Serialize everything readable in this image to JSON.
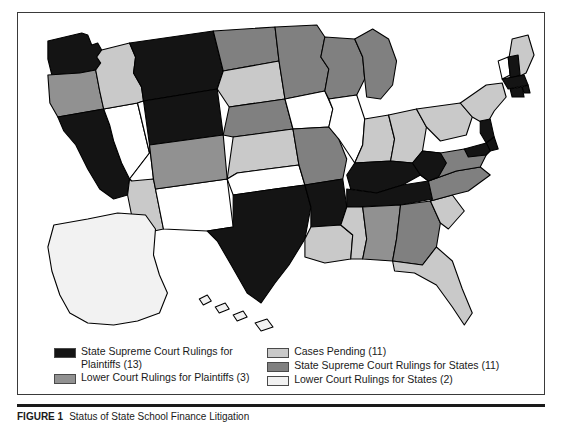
{
  "figure": {
    "caption_label": "FIGURE 1",
    "caption_text": "Status of State School Finance Litigation"
  },
  "legend": {
    "columns": [
      {
        "items": [
          {
            "label": "State Supreme Court Rulings for\n    Plaintiffs (13)",
            "color": "#141414",
            "category": "state-supreme-court-rulings-for-plaintiffs",
            "count": 13
          },
          {
            "label": "Lower Court Rulings for Plaintiffs (3)",
            "color": "#919191",
            "category": "lower-court-rulings-for-plaintiffs",
            "count": 3
          }
        ]
      },
      {
        "items": [
          {
            "label": "Cases Pending (11)",
            "color": "#c9c9c9",
            "category": "cases-pending",
            "count": 11
          },
          {
            "label": "State Supreme Court Rulings for States (11)",
            "color": "#808080",
            "category": "state-supreme-court-rulings-for-states",
            "count": 11
          },
          {
            "label": "Lower Court Rulings for States (2)",
            "color": "#f2f2f2",
            "category": "lower-court-rulings-for-states",
            "count": 2
          }
        ]
      }
    ]
  },
  "map": {
    "type": "choropleth",
    "region": "United States",
    "palette": {
      "state_supreme_plaintiffs": "#141414",
      "lower_court_plaintiffs": "#919191",
      "cases_pending": "#c9c9c9",
      "state_supreme_states": "#808080",
      "lower_court_states": "#f2f2f2",
      "no_data": "#ffffff"
    },
    "states": [
      {
        "code": "WA",
        "name": "Washington",
        "fill": "#141414"
      },
      {
        "code": "OR",
        "name": "Oregon",
        "fill": "#919191"
      },
      {
        "code": "CA",
        "name": "California",
        "fill": "#141414"
      },
      {
        "code": "NV",
        "name": "Nevada",
        "fill": "#ffffff"
      },
      {
        "code": "ID",
        "name": "Idaho",
        "fill": "#c9c9c9"
      },
      {
        "code": "MT",
        "name": "Montana",
        "fill": "#141414"
      },
      {
        "code": "WY",
        "name": "Wyoming",
        "fill": "#141414"
      },
      {
        "code": "UT",
        "name": "Utah",
        "fill": "#ffffff"
      },
      {
        "code": "AZ",
        "name": "Arizona",
        "fill": "#c9c9c9"
      },
      {
        "code": "NM",
        "name": "New Mexico",
        "fill": "#ffffff"
      },
      {
        "code": "CO",
        "name": "Colorado",
        "fill": "#919191"
      },
      {
        "code": "ND",
        "name": "North Dakota",
        "fill": "#808080"
      },
      {
        "code": "SD",
        "name": "South Dakota",
        "fill": "#c9c9c9"
      },
      {
        "code": "NE",
        "name": "Nebraska",
        "fill": "#808080"
      },
      {
        "code": "KS",
        "name": "Kansas",
        "fill": "#c9c9c9"
      },
      {
        "code": "OK",
        "name": "Oklahoma",
        "fill": "#ffffff"
      },
      {
        "code": "TX",
        "name": "Texas",
        "fill": "#141414"
      },
      {
        "code": "MN",
        "name": "Minnesota",
        "fill": "#808080"
      },
      {
        "code": "IA",
        "name": "Iowa",
        "fill": "#ffffff"
      },
      {
        "code": "MO",
        "name": "Missouri",
        "fill": "#808080"
      },
      {
        "code": "AR",
        "name": "Arkansas",
        "fill": "#141414"
      },
      {
        "code": "LA",
        "name": "Louisiana",
        "fill": "#c9c9c9"
      },
      {
        "code": "WI",
        "name": "Wisconsin",
        "fill": "#808080"
      },
      {
        "code": "IL",
        "name": "Illinois",
        "fill": "#ffffff"
      },
      {
        "code": "MI",
        "name": "Michigan",
        "fill": "#808080"
      },
      {
        "code": "IN",
        "name": "Indiana",
        "fill": "#c9c9c9"
      },
      {
        "code": "OH",
        "name": "Ohio",
        "fill": "#c9c9c9"
      },
      {
        "code": "KY",
        "name": "Kentucky",
        "fill": "#141414"
      },
      {
        "code": "TN",
        "name": "Tennessee",
        "fill": "#141414"
      },
      {
        "code": "MS",
        "name": "Mississippi",
        "fill": "#c9c9c9"
      },
      {
        "code": "AL",
        "name": "Alabama",
        "fill": "#919191"
      },
      {
        "code": "GA",
        "name": "Georgia",
        "fill": "#808080"
      },
      {
        "code": "FL",
        "name": "Florida",
        "fill": "#c9c9c9"
      },
      {
        "code": "SC",
        "name": "South Carolina",
        "fill": "#c9c9c9"
      },
      {
        "code": "NC",
        "name": "North Carolina",
        "fill": "#808080"
      },
      {
        "code": "VA",
        "name": "Virginia",
        "fill": "#808080"
      },
      {
        "code": "WV",
        "name": "West Virginia",
        "fill": "#141414"
      },
      {
        "code": "PA",
        "name": "Pennsylvania",
        "fill": "#c9c9c9"
      },
      {
        "code": "NY",
        "name": "New York",
        "fill": "#c9c9c9"
      },
      {
        "code": "ME",
        "name": "Maine",
        "fill": "#c9c9c9"
      },
      {
        "code": "VT",
        "name": "Vermont",
        "fill": "#ffffff"
      },
      {
        "code": "NH",
        "name": "New Hampshire",
        "fill": "#141414"
      },
      {
        "code": "MA",
        "name": "Massachusetts",
        "fill": "#141414"
      },
      {
        "code": "RI",
        "name": "Rhode Island",
        "fill": "#141414"
      },
      {
        "code": "CT",
        "name": "Connecticut",
        "fill": "#141414"
      },
      {
        "code": "NJ",
        "name": "New Jersey",
        "fill": "#141414"
      },
      {
        "code": "DE",
        "name": "Delaware",
        "fill": "#141414"
      },
      {
        "code": "MD",
        "name": "Maryland",
        "fill": "#141414"
      },
      {
        "code": "AK",
        "name": "Alaska",
        "fill": "#f2f2f2"
      },
      {
        "code": "HI",
        "name": "Hawaii",
        "fill": "#f2f2f2"
      }
    ]
  }
}
